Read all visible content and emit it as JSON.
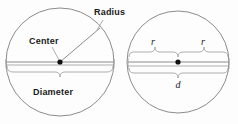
{
  "figure": {
    "colors": {
      "stroke": "#8c8c8c",
      "text": "#1a1a1a",
      "dot": "#111111",
      "background": "#fdfdfd"
    },
    "left_circle": {
      "name": "labeled-circle",
      "center_label": "Center",
      "radius_label": "Radius",
      "diameter_label": "Diameter"
    },
    "right_circle": {
      "name": "variable-circle",
      "radius_label_left": "r",
      "radius_label_right": "r",
      "diameter_label": "d"
    }
  }
}
